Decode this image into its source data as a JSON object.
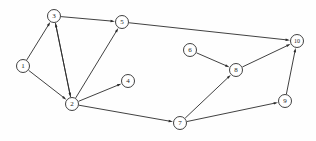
{
  "diagram": {
    "type": "directed-graph",
    "width": 316,
    "height": 141,
    "background_color": "#fefefe",
    "stroke_color": "#2b2b2b",
    "node_fill_color": "#ffffff",
    "node_radius": 6.5,
    "nodes": [
      {
        "id": "1",
        "label": "1",
        "x": 23,
        "y": 66
      },
      {
        "id": "2",
        "label": "2",
        "x": 72,
        "y": 104
      },
      {
        "id": "3",
        "label": "3",
        "x": 54,
        "y": 16
      },
      {
        "id": "4",
        "label": "4",
        "x": 128,
        "y": 81
      },
      {
        "id": "5",
        "label": "5",
        "x": 122,
        "y": 22
      },
      {
        "id": "6",
        "label": "6",
        "x": 190,
        "y": 50
      },
      {
        "id": "7",
        "label": "7",
        "x": 180,
        "y": 123
      },
      {
        "id": "8",
        "label": "8",
        "x": 236,
        "y": 70
      },
      {
        "id": "9",
        "label": "9",
        "x": 285,
        "y": 101
      },
      {
        "id": "10",
        "label": "10",
        "x": 297,
        "y": 41
      }
    ],
    "edges": [
      {
        "from": "1",
        "to": "3",
        "directed": true
      },
      {
        "from": "1",
        "to": "2",
        "directed": true
      },
      {
        "from": "2",
        "to": "3",
        "directed": true
      },
      {
        "from": "3",
        "to": "2",
        "directed": true
      },
      {
        "from": "3",
        "to": "5",
        "directed": true
      },
      {
        "from": "2",
        "to": "5",
        "directed": true
      },
      {
        "from": "2",
        "to": "4",
        "directed": true
      },
      {
        "from": "2",
        "to": "7",
        "directed": true
      },
      {
        "from": "5",
        "to": "10",
        "directed": true
      },
      {
        "from": "6",
        "to": "8",
        "directed": true
      },
      {
        "from": "7",
        "to": "8",
        "directed": true
      },
      {
        "from": "7",
        "to": "9",
        "directed": true
      },
      {
        "from": "8",
        "to": "10",
        "directed": true
      },
      {
        "from": "9",
        "to": "10",
        "directed": true
      }
    ]
  }
}
